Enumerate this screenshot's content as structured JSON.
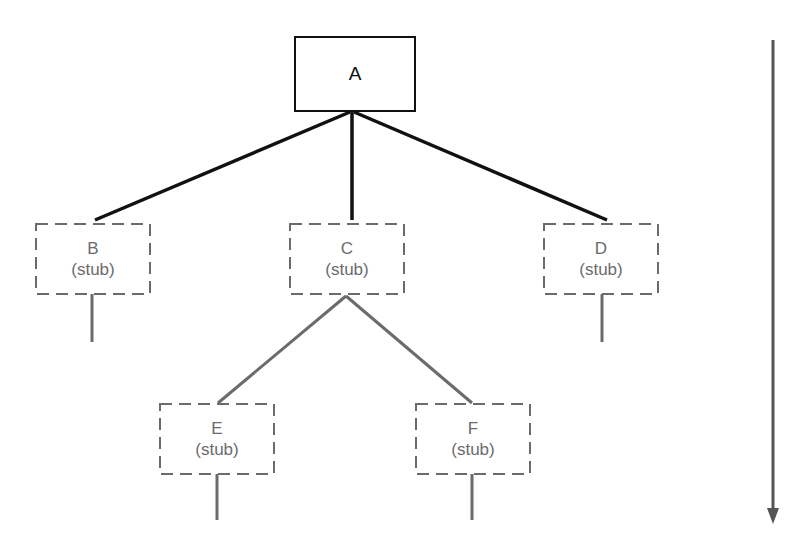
{
  "diagram": {
    "type": "top-down-integration-tree",
    "root": {
      "id": "A",
      "label": "A",
      "style": "solid"
    },
    "nodes": [
      {
        "id": "B",
        "label": "B",
        "sublabel": "(stub)",
        "style": "dashed",
        "parent": "A"
      },
      {
        "id": "C",
        "label": "C",
        "sublabel": "(stub)",
        "style": "dashed",
        "parent": "A"
      },
      {
        "id": "D",
        "label": "D",
        "sublabel": "(stub)",
        "style": "dashed",
        "parent": "A"
      },
      {
        "id": "E",
        "label": "E",
        "sublabel": "(stub)",
        "style": "dashed",
        "parent": "C"
      },
      {
        "id": "F",
        "label": "F",
        "sublabel": "(stub)",
        "style": "dashed",
        "parent": "C"
      }
    ],
    "edges": [
      {
        "from": "A",
        "to": "B",
        "style": "solid-black"
      },
      {
        "from": "A",
        "to": "C",
        "style": "solid-black"
      },
      {
        "from": "A",
        "to": "D",
        "style": "solid-black"
      },
      {
        "from": "C",
        "to": "E",
        "style": "solid-gray"
      },
      {
        "from": "C",
        "to": "F",
        "style": "solid-gray"
      }
    ],
    "direction_arrow": "downward",
    "colors": {
      "root_stroke": "#111111",
      "stub_stroke": "#6b6b6b",
      "arrow": "#555555"
    }
  }
}
